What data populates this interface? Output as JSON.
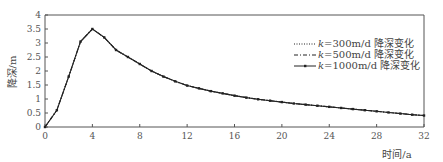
{
  "chart_data": {
    "type": "line",
    "title": "",
    "xlabel": "时间/a",
    "ylabel": "降深/m",
    "xlim": [
      0,
      32
    ],
    "ylim": [
      0,
      4
    ],
    "xticks": [
      0,
      4,
      8,
      12,
      16,
      20,
      24,
      28,
      32
    ],
    "yticks": [
      0,
      0.5,
      1,
      1.5,
      2,
      2.5,
      3,
      3.5,
      4
    ],
    "ytick_labels": [
      "0",
      "0.5",
      "1",
      "1.5",
      "2",
      "2.5",
      "3",
      "3.5",
      "4"
    ],
    "grid": false,
    "legend_position": "upper right",
    "x": [
      0,
      1,
      2,
      3,
      4,
      5,
      6,
      7,
      8,
      9,
      10,
      11,
      12,
      13,
      14,
      15,
      16,
      17,
      18,
      19,
      20,
      21,
      22,
      23,
      24,
      25,
      26,
      27,
      28,
      29,
      30,
      31,
      32
    ],
    "series": [
      {
        "name": "k=300m/d 降深变化",
        "style": "dotted",
        "values": [
          0,
          0.6,
          1.8,
          3.05,
          3.5,
          3.2,
          2.75,
          2.5,
          2.25,
          2.0,
          1.8,
          1.63,
          1.48,
          1.38,
          1.28,
          1.2,
          1.12,
          1.05,
          0.99,
          0.94,
          0.89,
          0.84,
          0.8,
          0.76,
          0.72,
          0.68,
          0.64,
          0.6,
          0.56,
          0.52,
          0.48,
          0.44,
          0.41
        ]
      },
      {
        "name": "k=500m/d 降深变化",
        "style": "dashdot",
        "values": [
          0,
          0.6,
          1.8,
          3.05,
          3.5,
          3.2,
          2.75,
          2.5,
          2.25,
          2.0,
          1.8,
          1.63,
          1.48,
          1.38,
          1.28,
          1.2,
          1.12,
          1.05,
          0.99,
          0.94,
          0.89,
          0.84,
          0.8,
          0.76,
          0.72,
          0.68,
          0.64,
          0.6,
          0.56,
          0.52,
          0.48,
          0.44,
          0.41
        ]
      },
      {
        "name": "k=1000m/d 降深变化",
        "style": "solid-marker",
        "values": [
          0,
          0.6,
          1.8,
          3.05,
          3.5,
          3.2,
          2.75,
          2.5,
          2.25,
          2.0,
          1.8,
          1.63,
          1.48,
          1.38,
          1.28,
          1.2,
          1.12,
          1.05,
          0.99,
          0.94,
          0.89,
          0.84,
          0.8,
          0.76,
          0.72,
          0.68,
          0.64,
          0.6,
          0.56,
          0.52,
          0.48,
          0.44,
          0.41
        ]
      }
    ]
  },
  "legend": {
    "items": [
      {
        "k": "k",
        "rest": "=300m/d 降深变化"
      },
      {
        "k": "k",
        "rest": "=500m/d 降深变化"
      },
      {
        "k": "k",
        "rest": "=1000m/d 降深变化"
      }
    ]
  },
  "colors": {
    "line": "#222222",
    "axis": "#555555"
  }
}
